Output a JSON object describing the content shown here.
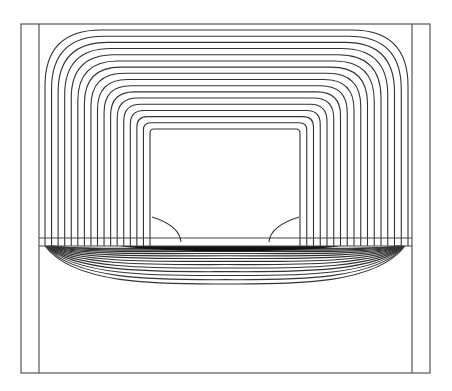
{
  "figure": {
    "title": "",
    "outer_frame": {
      "x1": 21,
      "y1": 24,
      "x2": 430,
      "y2": 373
    },
    "inner_left_x": 39,
    "inner_right_x": 412,
    "coil_window": {
      "x1": 151,
      "y1": 131,
      "x2": 299,
      "y2": 238
    },
    "gap_band": {
      "y_top": 238,
      "y_bottom": 246
    },
    "upper_contours": {
      "count": 17,
      "outer_top_y": 30,
      "inner_top_y": 129,
      "outer_left_x": 45,
      "inner_left_x": 150,
      "outer_right_x": 408,
      "inner_right_x": 300
    },
    "lower_contours": {
      "count": 14,
      "deepest_y": 284
    },
    "colors": {
      "background": "#ffffff",
      "lines": "#333333",
      "frame": "#555555"
    }
  }
}
